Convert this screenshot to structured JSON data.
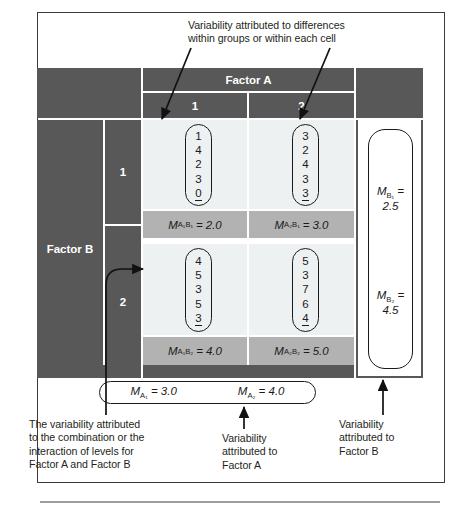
{
  "figure": {
    "type": "two-factor-anova-matrix",
    "table": {
      "column_factor": "Factor A",
      "row_factor": "Factor B",
      "column_levels": [
        "1",
        "2"
      ],
      "row_levels": [
        "1",
        "2"
      ],
      "cells": [
        {
          "id": "A1B1",
          "scores": [
            "1",
            "4",
            "2",
            "3",
            "0"
          ],
          "mean_label_prefix": "M",
          "mean_sub": "A₁B₁",
          "mean_value": "2.0",
          "mean_text": "M = 2.0"
        },
        {
          "id": "A2B1",
          "scores": [
            "3",
            "2",
            "4",
            "3",
            "3"
          ],
          "mean_label_prefix": "M",
          "mean_sub": "A₂B₁",
          "mean_value": "3.0",
          "mean_text": "M = 3.0"
        },
        {
          "id": "A1B2",
          "scores": [
            "4",
            "5",
            "3",
            "5",
            "3"
          ],
          "mean_label_prefix": "M",
          "mean_sub": "A₁B₂",
          "mean_value": "4.0",
          "mean_text": "M = 4.0"
        },
        {
          "id": "A2B2",
          "scores": [
            "5",
            "3",
            "7",
            "6",
            "4"
          ],
          "mean_label_prefix": "M",
          "mean_sub": "A₂B₂",
          "mean_value": "5.0",
          "mean_text": "M = 5.0"
        }
      ],
      "row_means": [
        {
          "id": "B1",
          "sub": "B₁",
          "value": "2.5"
        },
        {
          "id": "B2",
          "sub": "B₂",
          "value": "4.5"
        }
      ],
      "column_means": [
        {
          "id": "A1",
          "sub": "A₁",
          "value": "3.0"
        },
        {
          "id": "A2",
          "sub": "A₂",
          "value": "4.0"
        }
      ]
    },
    "annotations": {
      "within": "Variability attributed to differences\nwithin groups or within each cell",
      "interaction": "The variability attributed\nto the combination or the\ninteraction of levels for\nFactor A and Factor B",
      "factor_a": "Variability\nattributed to\nFactor A",
      "factor_b": "Variability\nattributed to\nFactor B"
    },
    "colors": {
      "header_gray": "#585858",
      "mean_strip_gray": "#b2b2b2",
      "cell_light": "#eef1f2",
      "frame": "#3b3b3b",
      "text": "#231f20",
      "header_text": "#ffffff"
    }
  }
}
